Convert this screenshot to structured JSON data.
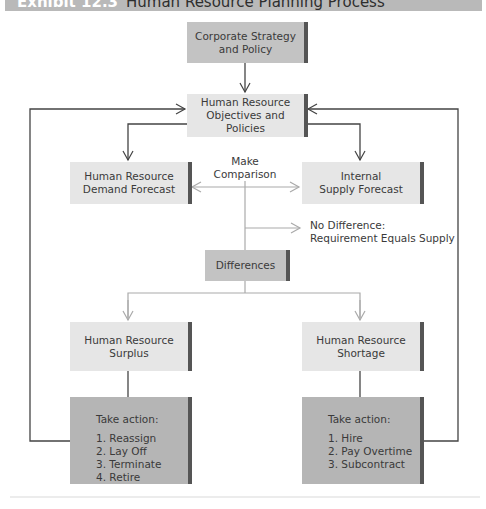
{
  "header": {
    "exhibit": "Exhibit 12.3",
    "title": "Human Resource Planning Process"
  },
  "nodes": {
    "corporate": "Corporate Strategy and Policy",
    "corporate_l1": "Corporate Strategy",
    "corporate_l2": "and Policy",
    "objectives_l1": "Human Resource",
    "objectives_l2": "Objectives and",
    "objectives_l3": "Policies",
    "demand_l1": "Human Resource",
    "demand_l2": "Demand Forecast",
    "supply_l1": "Internal",
    "supply_l2": "Supply Forecast",
    "differences": "Differences",
    "surplus_l1": "Human Resource",
    "surplus_l2": "Surplus",
    "shortage_l1": "Human Resource",
    "shortage_l2": "Shortage"
  },
  "labels": {
    "make_l1": "Make",
    "make_l2": "Comparison",
    "nodiff_l1": "No Difference:",
    "nodiff_l2": "Requirement Equals Supply"
  },
  "actions": {
    "surplus": {
      "heading": "Take action:",
      "items": [
        "1.  Reassign",
        "2.  Lay Off",
        "3.  Terminate",
        "4.  Retire"
      ]
    },
    "shortage": {
      "heading": "Take action:",
      "items": [
        "1.  Hire",
        "2.  Pay Overtime",
        "3.  Subcontract"
      ]
    }
  },
  "colors": {
    "header_bg": "#b9b9b9",
    "box_light": "#e6e6e6",
    "box_dark": "#c3c3c3",
    "box_action": "#b5b5b5",
    "line_dark": "#444444",
    "line_light": "#aaaaaa"
  }
}
